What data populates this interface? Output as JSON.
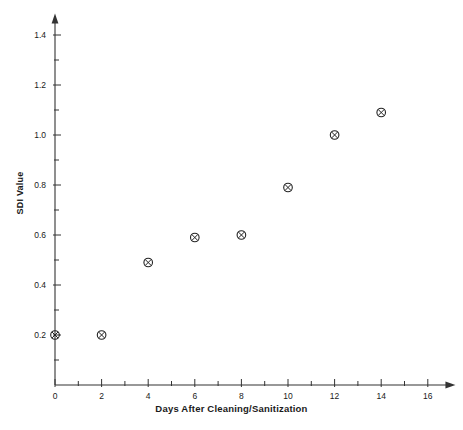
{
  "chart_data": {
    "type": "scatter",
    "title": "",
    "xlabel": "Days After Cleaning/Sanitization",
    "ylabel": "SDI Value",
    "xlim": [
      0,
      16.8
    ],
    "ylim": [
      0,
      1.45
    ],
    "xticks": [
      0,
      2,
      4,
      6,
      8,
      10,
      12,
      14,
      16
    ],
    "xtick_labels": [
      "0",
      "2",
      "4",
      "6",
      "8",
      "10",
      "12",
      "14",
      "16"
    ],
    "x_minor_tick_step": 1,
    "yticks": [
      0.2,
      0.4,
      0.6,
      0.8,
      1.0,
      1.2,
      1.4
    ],
    "ytick_labels": [
      "0.2",
      "0.4",
      "0.6",
      "0.8",
      "1.0",
      "1.2",
      "1.4"
    ],
    "y_minor_tick_step": 0.1,
    "grid": false,
    "legend": "none",
    "marker": "circle-with-x",
    "marker_color": "#222222",
    "axis_color": "#333333",
    "axis_arrows": true,
    "points": [
      {
        "x": 0,
        "y": 0.2
      },
      {
        "x": 2,
        "y": 0.2
      },
      {
        "x": 4,
        "y": 0.49
      },
      {
        "x": 6,
        "y": 0.59
      },
      {
        "x": 8,
        "y": 0.6
      },
      {
        "x": 10,
        "y": 0.79
      },
      {
        "x": 12,
        "y": 1.0
      },
      {
        "x": 14,
        "y": 1.09
      }
    ],
    "series": [
      {
        "name": "SDI Value",
        "x": [
          0,
          2,
          4,
          6,
          8,
          10,
          12,
          14
        ],
        "values": [
          0.2,
          0.2,
          0.49,
          0.59,
          0.6,
          0.79,
          1.0,
          1.09
        ]
      }
    ]
  }
}
